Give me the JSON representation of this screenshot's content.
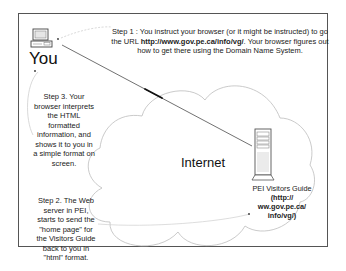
{
  "diagram": {
    "nodes": {
      "you": {
        "label": "You",
        "icon": "desktop-computer-icon"
      },
      "internet": {
        "label": "Internet",
        "shape": "cloud"
      },
      "server": {
        "icon": "tower-server-icon",
        "name": "PEI Visitors Guide",
        "url_line1": "(http://",
        "url_line2": "ww.gov.pe.ca/",
        "url_line3": "info/vg/)"
      }
    },
    "steps": {
      "step1": {
        "prefix": "Step 1 : You instruct your browser (or it might be instructed) to go the URL ",
        "url": "http://www.gov.pe.ca/info/vg/",
        "suffix": ". Your browser figures out how to get there using the Domain Name System."
      },
      "step2": "Step 2. The Web server in PEI, starts to send the \"home page\" for the Visitors Guide back to you in \"html\" format.",
      "step3": "Step 3. Your browser interprets the HTML formatted information, and shows it to you in a simple format on screen."
    },
    "colors": {
      "frame": "#555555",
      "cloud_outline": "#bbbbbb",
      "connection_line": "#333333",
      "text": "#222222"
    }
  }
}
